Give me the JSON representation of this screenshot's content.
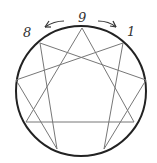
{
  "diagram": {
    "type": "enneagram",
    "colors": {
      "circle": "#222222",
      "lines": "#777777",
      "labels": "#333333",
      "background": "#ffffff"
    },
    "labels": {
      "top": "9",
      "left": "8",
      "right": "1"
    },
    "arrows": {
      "left": "arrow-counterclockwise",
      "right": "arrow-clockwise"
    }
  }
}
